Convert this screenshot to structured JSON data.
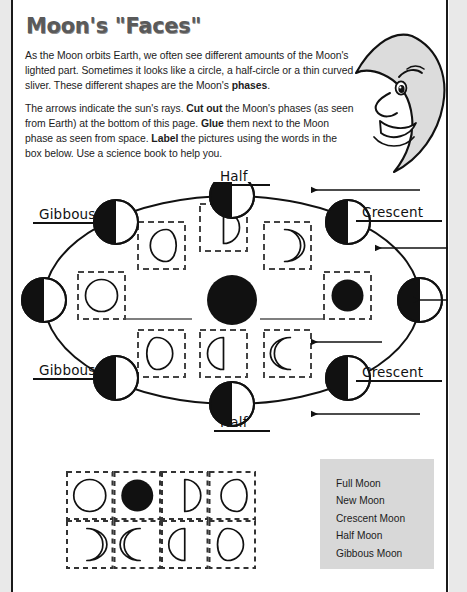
{
  "page": {
    "title": "Moon's \"Faces\"",
    "width": 467,
    "height": 592,
    "background": "#ffffff",
    "ink": "#111111"
  },
  "intro": {
    "paragraph1_parts": [
      {
        "text": "As the Moon orbits Earth, we often see different amounts of the Moon's lighted part.  Sometimes it looks like a circle, a half-circle or a thin curved sliver.  These different shapes are the Moon's ",
        "bold": false
      },
      {
        "text": "phases",
        "bold": true
      },
      {
        "text": ".",
        "bold": false
      }
    ],
    "paragraph2_parts": [
      {
        "text": "The arrows indicate the sun's rays. ",
        "bold": false
      },
      {
        "text": "Cut out",
        "bold": true
      },
      {
        "text": " the Moon's phases (as seen from Earth) at the bottom of this page. ",
        "bold": false
      },
      {
        "text": "Glue",
        "bold": true
      },
      {
        "text": " them next to the Moon phase as seen from space. ",
        "bold": false
      },
      {
        "text": "Label",
        "bold": true
      },
      {
        "text": " the pictures using the words in the box below. Use a science book to help you.",
        "bold": false
      }
    ]
  },
  "mascot": {
    "icon": "crescent-moon-face-icon",
    "fill": "#dcdcdc",
    "stroke": "#111111"
  },
  "diagram": {
    "name": "moon-phases-orbit-diagram",
    "orbit": {
      "cx": 216,
      "cy": 118,
      "rx": 188,
      "ry": 104,
      "stroke": "#111111",
      "stroke_width": 2
    },
    "earth": {
      "cx": 216,
      "cy": 118,
      "r": 25,
      "fill": "#111111",
      "label": "earth-center"
    },
    "moons": [
      {
        "name": "moon-position-top",
        "cx": 216,
        "cy": 14,
        "r": 22,
        "lit": "right"
      },
      {
        "name": "moon-position-top-left",
        "cx": 100,
        "cy": 40,
        "r": 22,
        "lit": "right"
      },
      {
        "name": "moon-position-left",
        "cx": 28,
        "cy": 118,
        "r": 22,
        "lit": "right"
      },
      {
        "name": "moon-position-bottom-left",
        "cx": 100,
        "cy": 196,
        "r": 22,
        "lit": "right"
      },
      {
        "name": "moon-position-bottom",
        "cx": 216,
        "cy": 222,
        "r": 22,
        "lit": "right"
      },
      {
        "name": "moon-position-bottom-right",
        "cx": 332,
        "cy": 196,
        "r": 22,
        "lit": "right"
      },
      {
        "name": "moon-position-right",
        "cx": 404,
        "cy": 118,
        "r": 22,
        "lit": "right"
      },
      {
        "name": "moon-position-top-right",
        "cx": 332,
        "cy": 40,
        "r": 22,
        "lit": "right"
      }
    ],
    "answer_boxes": [
      {
        "name": "answer-box-full-moon",
        "x": 62,
        "y": 90,
        "w": 47,
        "h": 47,
        "shape": "full-circle-outline"
      },
      {
        "name": "answer-box-gibbous-waning",
        "x": 122,
        "y": 40,
        "w": 47,
        "h": 47,
        "shape": "gibbous-left-outline"
      },
      {
        "name": "answer-box-half-waning",
        "x": 184,
        "y": 22,
        "w": 47,
        "h": 47,
        "shape": "half-right-outline"
      },
      {
        "name": "answer-box-crescent-waning",
        "x": 248,
        "y": 40,
        "w": 47,
        "h": 47,
        "shape": "crescent-right-outline"
      },
      {
        "name": "answer-box-new-moon",
        "x": 308,
        "y": 90,
        "w": 47,
        "h": 47,
        "shape": "new-moon-filled"
      },
      {
        "name": "answer-box-crescent-waxing",
        "x": 248,
        "y": 148,
        "w": 47,
        "h": 47,
        "shape": "crescent-left-outline"
      },
      {
        "name": "answer-box-half-waxing",
        "x": 184,
        "y": 148,
        "w": 47,
        "h": 47,
        "shape": "half-left-outline"
      },
      {
        "name": "answer-box-gibbous-waxing",
        "x": 122,
        "y": 148,
        "w": 47,
        "h": 47,
        "shape": "gibbous-right-outline"
      }
    ],
    "blank_lines": [
      {
        "name": "answer-line-left",
        "x1": 110,
        "y1": 137,
        "x2": 176,
        "y2": 137
      },
      {
        "name": "answer-line-right",
        "x1": 244,
        "y1": 137,
        "x2": 308,
        "y2": 137
      }
    ],
    "sun_rays": [
      {
        "name": "sun-ray-arrow-1",
        "x1": 404,
        "y1": 8,
        "x2": 296,
        "y2": 8
      },
      {
        "name": "sun-ray-arrow-2",
        "x1": 432,
        "y1": 66,
        "x2": 360,
        "y2": 66
      },
      {
        "name": "sun-ray-arrow-3",
        "x1": 432,
        "y1": 118,
        "x2": 398,
        "y2": 118
      },
      {
        "name": "sun-ray-arrow-4",
        "x1": 366,
        "y1": 160,
        "x2": 296,
        "y2": 160
      },
      {
        "name": "sun-ray-arrow-5",
        "x1": 404,
        "y1": 232,
        "x2": 296,
        "y2": 232
      }
    ],
    "labels": [
      {
        "name": "label-half-top",
        "text": "Half",
        "left": 198,
        "top": -14,
        "width": 56
      },
      {
        "name": "label-gibbous-upper-left",
        "text": "Gibbous",
        "left": 17,
        "top": 24,
        "width": 78
      },
      {
        "name": "label-gibbous-lower-left",
        "text": "Gibbous",
        "left": 17,
        "top": 180,
        "width": 78
      },
      {
        "name": "label-crescent-upper",
        "text": "Crescent",
        "left": 340,
        "top": 22,
        "width": 86
      },
      {
        "name": "label-crescent-lower",
        "text": "Crescent",
        "left": 340,
        "top": 182,
        "width": 86
      },
      {
        "name": "label-half-bottom",
        "text": "Half",
        "left": 198,
        "top": 232,
        "width": 56
      }
    ]
  },
  "cutout_strip": {
    "name": "cut-out-phase-cards",
    "rows": 2,
    "cols": 4,
    "cells": [
      {
        "name": "cut-card-full-moon",
        "shape": "full-circle-outline"
      },
      {
        "name": "cut-card-new-moon",
        "shape": "new-moon-filled"
      },
      {
        "name": "cut-card-half-right",
        "shape": "half-right-outline"
      },
      {
        "name": "cut-card-gibbous-left",
        "shape": "gibbous-left-outline"
      },
      {
        "name": "cut-card-crescent-right",
        "shape": "crescent-right-outline"
      },
      {
        "name": "cut-card-crescent-left",
        "shape": "crescent-left-outline"
      },
      {
        "name": "cut-card-half-left",
        "shape": "half-left-outline"
      },
      {
        "name": "cut-card-gibbous-right",
        "shape": "gibbous-right-outline"
      }
    ]
  },
  "word_bank": {
    "name": "word-bank",
    "background": "#d8d8d8",
    "words": [
      "Full Moon",
      "New Moon",
      "Crescent Moon",
      "Half Moon",
      "Gibbous Moon"
    ]
  }
}
